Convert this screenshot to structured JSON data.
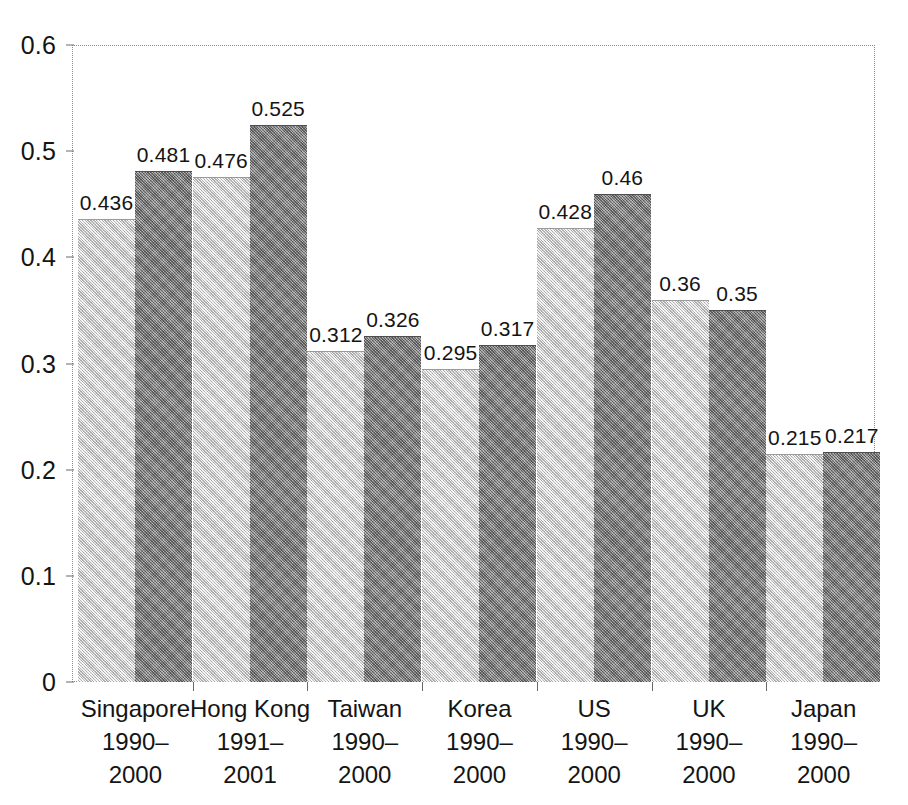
{
  "chart_data": {
    "type": "bar",
    "title": "",
    "subtitle": "",
    "xlabel": "",
    "ylabel": "",
    "ylim": [
      0,
      0.6
    ],
    "y_ticks": [
      "0",
      "0.1",
      "0.2",
      "0.3",
      "0.4",
      "0.5",
      "0.6"
    ],
    "y_tick_values": [
      0,
      0.1,
      0.2,
      0.3,
      0.4,
      0.5,
      0.6
    ],
    "grid": false,
    "legend": "none",
    "categories": [
      "Singapore",
      "Hong Kong",
      "Taiwan",
      "Korea",
      "US",
      "UK",
      "Japan"
    ],
    "category_periods": [
      [
        "1990–",
        "2000"
      ],
      [
        "1991–",
        "2001"
      ],
      [
        "1990–",
        "2000"
      ],
      [
        "1990–",
        "2000"
      ],
      [
        "1990–",
        "2000"
      ],
      [
        "1990–",
        "2000"
      ],
      [
        "1990–",
        "2000"
      ]
    ],
    "series": [
      {
        "name": "first",
        "color": "#cfcfcf",
        "values": [
          0.436,
          0.476,
          0.312,
          0.295,
          0.428,
          0.36,
          0.215
        ],
        "labels": [
          "0.436",
          "0.476",
          "0.312",
          "0.295",
          "0.428",
          "0.36",
          "0.215"
        ]
      },
      {
        "name": "second",
        "color": "#7a7a7a",
        "values": [
          0.481,
          0.525,
          0.326,
          0.317,
          0.46,
          0.35,
          0.217
        ],
        "labels": [
          "0.481",
          "0.525",
          "0.326",
          "0.317",
          "0.46",
          "0.35",
          "0.217"
        ]
      }
    ]
  },
  "colors": {
    "series_light": "#cfcfcf",
    "series_dark": "#7a7a7a",
    "axis": "#6a6a6a",
    "text": "#141414",
    "background": "#ffffff"
  }
}
